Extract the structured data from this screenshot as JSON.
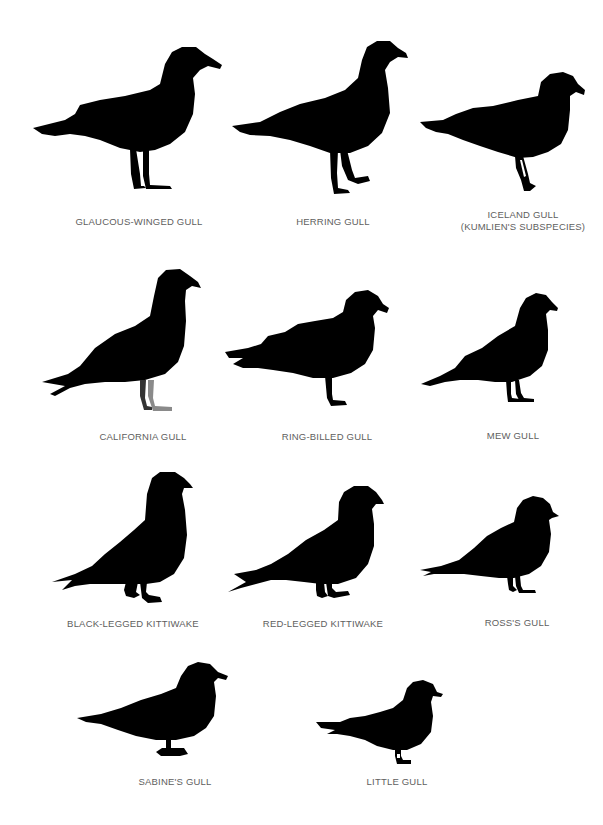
{
  "plate": {
    "silhouette_color": "#000000",
    "leg_color_gray": "#8a8a8a",
    "label_color": "#5e5e5e",
    "rows": [
      {
        "row": 1,
        "birds": [
          {
            "id": "glaucous-winged-gull",
            "label": "GLAUCOUS-WINGED GULL"
          },
          {
            "id": "herring-gull",
            "label": "HERRING GULL"
          },
          {
            "id": "iceland-gull",
            "label": "ICELAND GULL",
            "label_line2": "(KUMLIEN'S SUBSPECIES)"
          }
        ]
      },
      {
        "row": 2,
        "birds": [
          {
            "id": "california-gull",
            "label": "CALIFORNIA GULL"
          },
          {
            "id": "ring-billed-gull",
            "label": "RING-BILLED GULL"
          },
          {
            "id": "mew-gull",
            "label": "MEW GULL"
          }
        ]
      },
      {
        "row": 3,
        "birds": [
          {
            "id": "black-legged-kittiwake",
            "label": "BLACK-LEGGED KITTIWAKE"
          },
          {
            "id": "red-legged-kittiwake",
            "label": "RED-LEGGED KITTIWAKE"
          },
          {
            "id": "rosss-gull",
            "label": "ROSS'S GULL"
          }
        ]
      },
      {
        "row": 4,
        "birds": [
          {
            "id": "sabines-gull",
            "label": "SABINE'S GULL"
          },
          {
            "id": "little-gull",
            "label": "LITTLE GULL"
          }
        ]
      }
    ]
  }
}
